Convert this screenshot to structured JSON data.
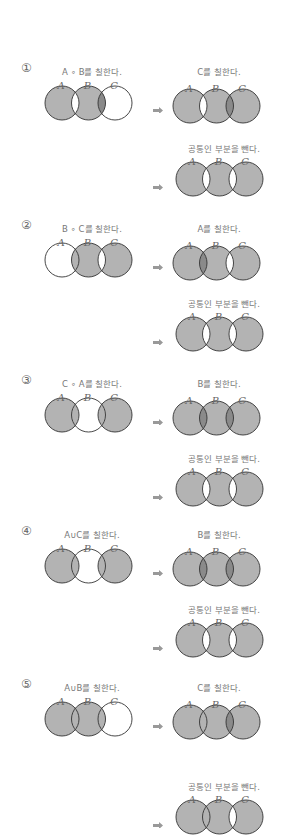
{
  "colors": {
    "light": "#b3b3b3",
    "dark": "#8a8a8a",
    "white": "#ffffff",
    "stroke": "#333333",
    "arrow": "#999999"
  },
  "circle_labels": [
    "A",
    "B",
    "C"
  ],
  "options": [
    {
      "number": "①",
      "y": 60,
      "left": {
        "caption": "A ∘ B를 칠한다.",
        "regions": {
          "a": 1,
          "ab": 0,
          "b": 1,
          "bc": 2,
          "c": 0
        }
      },
      "right": {
        "caption": "C를 칠한다.",
        "regions": {
          "a": 1,
          "ab": 0,
          "b": 1,
          "bc": 2,
          "c": 1
        }
      },
      "result": {
        "caption": "공통인 부분을 뺀다.",
        "regions": {
          "a": 1,
          "ab": 0,
          "b": 1,
          "bc": 0,
          "c": 1
        }
      }
    },
    {
      "number": "②",
      "y": 217,
      "left": {
        "caption": "B ∘ C를 칠한다.",
        "regions": {
          "a": 0,
          "ab": 1,
          "b": 1,
          "bc": 0,
          "c": 1
        }
      },
      "right": {
        "caption": "A를 칠한다.",
        "regions": {
          "a": 1,
          "ab": 2,
          "b": 1,
          "bc": 0,
          "c": 1
        }
      },
      "result": {
        "caption": "공통인 부분을 뺀다.",
        "regions": {
          "a": 1,
          "ab": 0,
          "b": 1,
          "bc": 0,
          "c": 1
        }
      }
    },
    {
      "number": "③",
      "y": 372,
      "left": {
        "caption": "C ∘ A를 칠한다.",
        "regions": {
          "a": 1,
          "ab": 1,
          "b": 0,
          "bc": 1,
          "c": 1
        }
      },
      "right": {
        "caption": "B를 칠한다.",
        "regions": {
          "a": 1,
          "ab": 2,
          "b": 1,
          "bc": 2,
          "c": 1
        }
      },
      "result": {
        "caption": "공통인 부분을 뺀다.",
        "regions": {
          "a": 1,
          "ab": 0,
          "b": 1,
          "bc": 0,
          "c": 1
        }
      }
    },
    {
      "number": "④",
      "y": 523,
      "left": {
        "caption": "A∪C를 칠한다.",
        "regions": {
          "a": 1,
          "ab": 1,
          "b": 0,
          "bc": 1,
          "c": 1
        }
      },
      "right": {
        "caption": "B를 칠한다.",
        "regions": {
          "a": 1,
          "ab": 2,
          "b": 1,
          "bc": 2,
          "c": 1
        }
      },
      "result": {
        "caption": "공통인 부분을 뺀다.",
        "regions": {
          "a": 1,
          "ab": 0,
          "b": 1,
          "bc": 0,
          "c": 1
        }
      }
    },
    {
      "number": "⑤",
      "y": 676,
      "left": {
        "caption": "A∪B를 칠한다.",
        "regions": {
          "a": 1,
          "ab": 1,
          "b": 1,
          "bc": 1,
          "c": 0
        }
      },
      "right": {
        "caption": "C를 칠한다.",
        "regions": {
          "a": 1,
          "ab": 1,
          "b": 1,
          "bc": 2,
          "c": 1
        }
      },
      "result": {
        "caption": "공통인 부분을 뺀다.",
        "regions": {
          "a": 1,
          "ab": 1,
          "b": 1,
          "bc": 0,
          "c": 1
        }
      }
    }
  ]
}
